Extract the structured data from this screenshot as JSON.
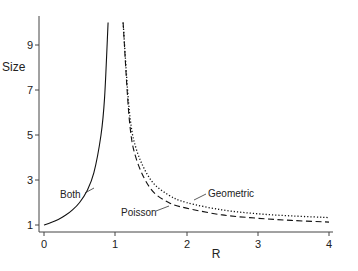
{
  "chart_data": {
    "type": "line",
    "title": "",
    "xlabel": "R",
    "ylabel": "Size",
    "xlim": [
      0,
      4
    ],
    "ylim": [
      1,
      10
    ],
    "x_ticks": [
      "0",
      "1",
      "2",
      "3",
      "4"
    ],
    "y_ticks": [
      "1",
      "3",
      "5",
      "7",
      "9"
    ],
    "grid": false,
    "legend": "none (inline annotations)",
    "series": [
      {
        "name": "Both",
        "style": "solid",
        "x": [
          0,
          0.1,
          0.2,
          0.3,
          0.4,
          0.5,
          0.6,
          0.7,
          0.8,
          0.85,
          0.9
        ],
        "values": [
          1,
          1.11,
          1.25,
          1.43,
          1.67,
          2.0,
          2.5,
          3.33,
          5.0,
          6.67,
          10.0
        ]
      },
      {
        "name": "Geometric",
        "style": "dotted",
        "x": [
          1.11,
          1.2,
          1.3,
          1.5,
          1.75,
          2.0,
          2.5,
          3.0,
          3.5,
          4.0
        ],
        "values": [
          10.0,
          6.0,
          4.33,
          3.0,
          2.33,
          2.0,
          1.67,
          1.5,
          1.4,
          1.33
        ]
      },
      {
        "name": "Poisson",
        "style": "dashed",
        "x": [
          1.11,
          1.2,
          1.3,
          1.5,
          1.75,
          2.0,
          2.5,
          3.0,
          3.5,
          4.0
        ],
        "values": [
          10.0,
          5.6,
          3.9,
          2.6,
          2.0,
          1.75,
          1.45,
          1.3,
          1.2,
          1.13
        ]
      }
    ],
    "annotations": [
      {
        "text": "Both",
        "near_x": 0.65,
        "near_y": 2.6
      },
      {
        "text": "Geometric",
        "near_x": 2.25,
        "near_y": 2.4
      },
      {
        "text": "Poisson",
        "near_x": 1.15,
        "near_y": 1.6
      }
    ]
  },
  "labels": {
    "xlabel": "R",
    "ylabel": "Size",
    "x_ticks": [
      "0",
      "1",
      "2",
      "3",
      "4"
    ],
    "y_ticks": [
      "1",
      "3",
      "5",
      "7",
      "9"
    ],
    "both": "Both",
    "geometric": "Geometric",
    "poisson": "Poisson"
  }
}
